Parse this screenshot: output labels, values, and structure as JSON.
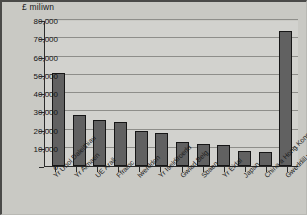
{
  "figure": {
    "axis_title": "£ miliwn",
    "background_color": "#c9c9c4",
    "plot_background_color": "#d2d2ce",
    "bar_fill_color": "#616161",
    "bar_border_color": "#161616",
    "gridline_color": "#8e8e8a",
    "axis_color": "#2b2b2b"
  },
  "chart_data": {
    "type": "bar",
    "title": "",
    "subtitle": "",
    "xlabel": "",
    "ylabel": "£ miliwn",
    "ylim": [
      0,
      80000
    ],
    "ytick_values": [
      0,
      10000,
      20000,
      30000,
      40000,
      50000,
      60000,
      70000,
      80000
    ],
    "ytick_labels": [
      "0",
      "10,000",
      "20,000",
      "30,000",
      "40,000",
      "50,000",
      "60,000",
      "70,000",
      "80,000"
    ],
    "grid": true,
    "grid_axis": "y",
    "legend": false,
    "legend_position": "none",
    "categories": [
      "Yr Unol Daleithiau",
      "Yr Almaen",
      "UE Arall",
      "Ffrainc",
      "Iwerddon",
      "Yr Iseldiroedd",
      "Gwlad Belg",
      "Sbaen",
      "Yr Eidal",
      "Japan",
      "China a Hong Kong",
      "Gweddill y Byd"
    ],
    "values": [
      51000,
      28200,
      25000,
      24300,
      19400,
      17900,
      13200,
      12000,
      11600,
      8200,
      7700,
      73800
    ],
    "units": "£ miliwn"
  }
}
